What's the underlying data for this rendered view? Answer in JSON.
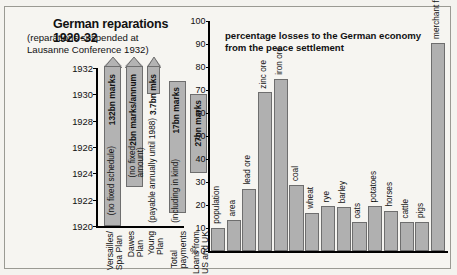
{
  "left_chart": {
    "title": "German reparations 1920-32",
    "subtitle": "(reparations suspended at\nLausanne Conference 1932)",
    "y_axis": {
      "ticks": [
        "1932",
        "1930",
        "1928",
        "1926",
        "1924",
        "1922",
        "1920"
      ],
      "min": 1920,
      "max": 1932
    },
    "bars": [
      {
        "category": "Versailles/\nSpa Plan",
        "amount_label": "132bn marks",
        "note": "(no fixed schedule)",
        "start": 1920,
        "end": 1932,
        "open_ended": true
      },
      {
        "category": "Dawes\nPlan",
        "amount_label": "2bn marks/annum",
        "note": "(no fixed\namount)",
        "start": 1923,
        "end": 1932,
        "open_ended": true
      },
      {
        "category": "Young\nPlan",
        "amount_label": "3.7bn mks",
        "note": "(payable annually until 1988)",
        "start": 1930,
        "end": 1932,
        "open_ended": true
      },
      {
        "category": "Total\npayments",
        "amount_label": "17bn marks",
        "note": "(including in kind)",
        "start": 1921,
        "end": 1931,
        "open_ended": false
      },
      {
        "category": "Loans from\nUS and UK",
        "amount_label": "27bn marks",
        "note": "",
        "start": 1924,
        "end": 1930,
        "open_ended": false
      }
    ]
  },
  "chart_data": {
    "type": "bar",
    "xlabel": "",
    "ylabel": "%",
    "ylim": [
      0,
      100
    ],
    "yticks": [
      0,
      10,
      20,
      30,
      40,
      50,
      60,
      70,
      80,
      90,
      100
    ],
    "y_axis_origin_label": "% 0",
    "grid": false,
    "legend": "none",
    "categories": [
      "population",
      "area",
      "lead ore",
      "zinc ore",
      "iron ore",
      "coal",
      "wheat",
      "rye",
      "barley",
      "oats",
      "potatoes",
      "horses",
      "cattle",
      "pigs",
      "merchant fleet"
    ],
    "values": [
      10,
      13.5,
      27,
      69,
      75,
      28.5,
      16.5,
      19.5,
      19,
      12.5,
      19.5,
      17.5,
      12.5,
      12.5,
      90.5
    ]
  }
}
